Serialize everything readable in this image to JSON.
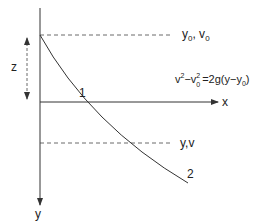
{
  "axes": {
    "x_label": "x",
    "y_label": "y"
  },
  "levels": {
    "top": {
      "label_main": "y",
      "sub1": "0",
      "sep": ", v",
      "sub2": "0"
    },
    "bottom": {
      "label": "y,v"
    }
  },
  "distance": {
    "label": "z"
  },
  "equation": {
    "v": "v",
    "sup1": "2",
    "minus_v": "−v",
    "sub0": "0",
    "sup2": "2",
    "rhs": "=2g(y−y",
    "rhs_sub": "0",
    "close": ")"
  },
  "curve_markers": {
    "point1": "1",
    "point2": "2"
  },
  "colors": {
    "line": "#333333",
    "dashed": "#444444",
    "text": "#222222"
  }
}
